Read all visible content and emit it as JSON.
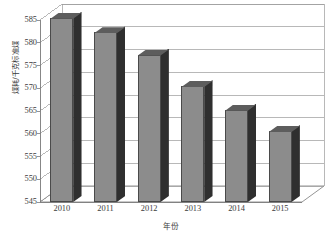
{
  "chart_data": {
    "type": "bar",
    "title": "",
    "subtitle": "",
    "xlabel": "年份",
    "ylabel": "煤耗/千克标准煤",
    "categories": [
      "2010",
      "2011",
      "2012",
      "2013",
      "2014",
      "2015"
    ],
    "values": [
      585.5,
      582.3,
      577.4,
      570.5,
      565.3,
      560.6
    ],
    "series": [
      {
        "name": "煤耗",
        "values": [
          585.5,
          582.3,
          577.4,
          570.5,
          565.3,
          560.6
        ]
      }
    ],
    "ylim": [
      545,
      585
    ],
    "ytick_labels": [
      "545",
      "550",
      "555",
      "560",
      "565",
      "570",
      "575",
      "580",
      "585"
    ],
    "ytick_values": [
      545,
      550,
      555,
      560,
      565,
      570,
      575,
      580,
      585
    ],
    "xtick_labels": [
      "2010",
      "2011",
      "2012",
      "2013",
      "2014",
      "2015"
    ],
    "grid": true,
    "grid_axis": "y",
    "legend": false,
    "legend_position": "none",
    "style": "3d-column",
    "colors": {
      "bar_front": "#8c8c8c",
      "bar_side": "#2f2f2f",
      "bar_top": "#5d5d5d",
      "grid": "#9a9a9a",
      "axis": "#7a7a7a",
      "text": "#3c3c3c",
      "plot_background": "#ffffff"
    }
  }
}
